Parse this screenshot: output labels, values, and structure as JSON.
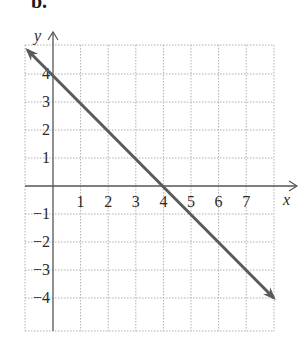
{
  "part_label": "b.",
  "chart_data": {
    "type": "line",
    "title": "",
    "xlabel": "x",
    "ylabel": "y",
    "xlim": [
      -1,
      8
    ],
    "ylim": [
      -5,
      5
    ],
    "grid": true,
    "x_tick_labels": [
      "1",
      "2",
      "3",
      "4",
      "5",
      "6",
      "7"
    ],
    "y_tick_labels": [
      "4",
      "3",
      "2",
      "1",
      "-1",
      "-2",
      "-3",
      "-4"
    ],
    "series": [
      {
        "name": "y = -x + 4",
        "x": [
          -1,
          0,
          4,
          8
        ],
        "y": [
          5,
          4,
          0,
          -4
        ],
        "arrows_both_ends": true,
        "color": "#5a5a5a"
      }
    ],
    "intercepts": {
      "x_intercept": 4,
      "y_intercept": 4
    }
  },
  "colors": {
    "axis": "#555555",
    "grid": "#b0b0b0",
    "line": "#5a5a5a"
  }
}
